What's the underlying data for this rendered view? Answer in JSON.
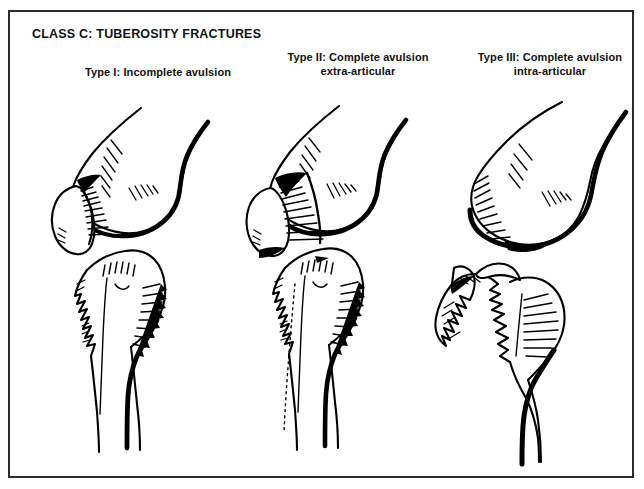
{
  "running_header": {
    "text": "PROXIMAL HUMERUS FRACTURES",
    "note": "cropped at top edge of image, only descenders visible"
  },
  "figure": {
    "title": "CLASS C: TUBEROSITY FRACTURES",
    "border_color": "#2b2b2b",
    "background_color": "#ffffff",
    "ink_color": "#000000"
  },
  "panels": [
    {
      "id": "type-1",
      "caption_line1": "Type I: Incomplete avulsion",
      "caption_line2": "",
      "illustration_name": "humerus-incomplete-avulsion-drawing"
    },
    {
      "id": "type-2",
      "caption_line1": "Type II: Complete avulsion",
      "caption_line2": "extra-articular",
      "illustration_name": "humerus-complete-avulsion-extraarticular-drawing"
    },
    {
      "id": "type-3",
      "caption_line1": "Type III: Complete avulsion",
      "caption_line2": "intra-articular",
      "illustration_name": "humerus-complete-avulsion-intraarticular-drawing"
    }
  ]
}
